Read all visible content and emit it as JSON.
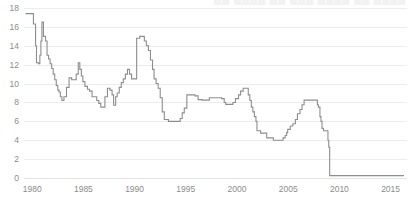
{
  "chart_data": {
    "type": "line",
    "title": "",
    "xlabel": "",
    "ylabel": "",
    "xlim": [
      1979.2,
      2016.6
    ],
    "ylim": [
      0,
      18
    ],
    "grid": true,
    "grid_axis": "y",
    "legend": "none",
    "line_color": "#8d8d8d",
    "grid_color": "#ececec",
    "tick_color": "#8c8c8c",
    "background": "#ffffff",
    "step_style": "post",
    "y_ticks": [
      0,
      2,
      4,
      6,
      8,
      10,
      12,
      14,
      16,
      18
    ],
    "y_tick_labels": [
      "0",
      "2",
      "4",
      "6",
      "8",
      "10",
      "12",
      "14",
      "16",
      "18"
    ],
    "x_ticks": [
      1980,
      1985,
      1990,
      1995,
      2000,
      2005,
      2010,
      2015
    ],
    "x_tick_labels": [
      "1980",
      "1985",
      "1990",
      "1995",
      "2000",
      "2005",
      "2010",
      "2015"
    ],
    "series": [
      {
        "name": "Prime Rate",
        "color": "#8d8d8d",
        "x": [
          1979.35,
          1979.95,
          1980.12,
          1980.25,
          1980.33,
          1980.42,
          1980.5,
          1980.62,
          1980.75,
          1980.85,
          1980.95,
          1981.1,
          1981.3,
          1981.45,
          1981.6,
          1981.75,
          1981.9,
          1982.05,
          1982.2,
          1982.35,
          1982.5,
          1982.62,
          1982.75,
          1982.9,
          1983.1,
          1983.35,
          1983.6,
          1983.85,
          1984.1,
          1984.3,
          1984.5,
          1984.65,
          1984.8,
          1984.95,
          1985.15,
          1985.4,
          1985.6,
          1985.85,
          1986.1,
          1986.3,
          1986.5,
          1986.7,
          1986.9,
          1987.1,
          1987.35,
          1987.6,
          1987.8,
          1987.95,
          1988.15,
          1988.3,
          1988.5,
          1988.7,
          1988.9,
          1989.1,
          1989.3,
          1989.5,
          1989.7,
          1989.9,
          1990.2,
          1990.5,
          1990.8,
          1990.95,
          1991.15,
          1991.35,
          1991.55,
          1991.75,
          1991.9,
          1992.1,
          1992.3,
          1992.5,
          1992.7,
          1992.9,
          1993.3,
          1993.8,
          1994.2,
          1994.45,
          1994.65,
          1994.85,
          1995.1,
          1995.3,
          1995.6,
          1995.9,
          1996.2,
          1996.6,
          1997.0,
          1997.3,
          1997.7,
          1998.1,
          1998.5,
          1998.75,
          1998.9,
          1999.2,
          1999.6,
          1999.85,
          2000.15,
          2000.35,
          2000.6,
          2000.95,
          2001.1,
          2001.25,
          2001.4,
          2001.55,
          2001.7,
          2001.85,
          2001.95,
          2002.3,
          2002.7,
          2002.9,
          2003.3,
          2003.55,
          2003.9,
          2004.5,
          2004.7,
          2004.85,
          2004.95,
          2005.2,
          2005.45,
          2005.7,
          2005.9,
          2006.15,
          2006.35,
          2006.55,
          2006.8,
          2007.3,
          2007.7,
          2007.85,
          2007.95,
          2008.1,
          2008.2,
          2008.3,
          2008.45,
          2008.75,
          2008.88,
          2008.96,
          2009.05,
          2010.0,
          2011.0,
          2012.0,
          2013.0,
          2014.0,
          2015.0,
          2016.3
        ],
        "values": [
          17.4,
          17.4,
          16.3,
          16.3,
          14.0,
          12.2,
          12.2,
          12.1,
          13.0,
          14.5,
          16.5,
          15.0,
          14.5,
          13.0,
          12.6,
          12.1,
          11.6,
          11.0,
          10.4,
          9.8,
          9.3,
          9.1,
          8.6,
          8.2,
          8.6,
          9.6,
          10.6,
          10.4,
          10.4,
          11.0,
          12.2,
          11.5,
          10.8,
          10.2,
          9.7,
          9.4,
          9.2,
          8.6,
          8.6,
          8.2,
          7.9,
          7.5,
          7.5,
          8.6,
          9.5,
          9.3,
          8.8,
          7.7,
          8.6,
          9.0,
          9.6,
          10.1,
          10.5,
          11.0,
          11.5,
          11.0,
          10.5,
          10.5,
          14.8,
          15.0,
          15.0,
          14.5,
          14.0,
          13.5,
          12.5,
          11.5,
          10.5,
          10.0,
          9.5,
          8.5,
          7.0,
          6.2,
          6.0,
          6.0,
          6.0,
          6.3,
          6.9,
          7.4,
          8.8,
          8.8,
          8.8,
          8.7,
          8.3,
          8.25,
          8.25,
          8.5,
          8.5,
          8.5,
          8.4,
          8.0,
          7.8,
          7.8,
          8.0,
          8.4,
          8.8,
          9.2,
          9.5,
          9.5,
          8.8,
          8.2,
          7.5,
          7.0,
          6.5,
          6.0,
          5.0,
          4.75,
          4.75,
          4.25,
          4.25,
          4.0,
          4.0,
          4.25,
          4.5,
          4.8,
          5.15,
          5.5,
          5.75,
          6.2,
          6.8,
          7.25,
          7.75,
          8.25,
          8.25,
          8.25,
          8.25,
          7.75,
          7.5,
          6.5,
          6.0,
          5.25,
          5.0,
          5.0,
          4.0,
          3.25,
          0.25,
          0.25,
          0.25,
          0.25,
          0.25,
          0.25,
          0.25,
          0.25
        ]
      }
    ],
    "annotations": []
  },
  "topstrip": {
    "clipped_text": "██ ████ ██ ███ ████ ██ ████"
  }
}
